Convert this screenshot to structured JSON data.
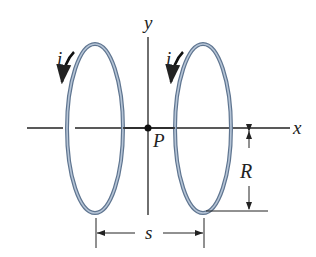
{
  "diagram": {
    "type": "two coaxial current loops",
    "labels": {
      "y_axis": "y",
      "x_axis": "x",
      "point": "P",
      "current_left": "i",
      "current_right": "i",
      "radius": "R",
      "separation": "s"
    },
    "colors": {
      "loop": "#8a9fb8",
      "loop_edge": "#5f7590",
      "lines": "#222222"
    }
  }
}
